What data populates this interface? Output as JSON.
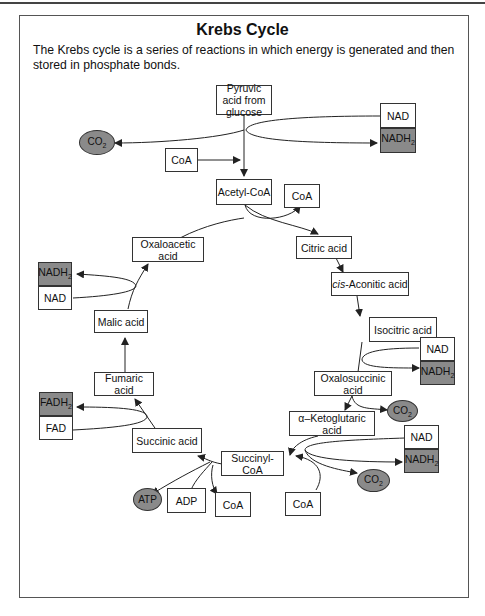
{
  "title": "Krebs Cycle",
  "description": "The Krebs cycle is a series of reactions in which energy is generated and then stored in phosphate bonds.",
  "nodes": {
    "pyruvic": "Pyruvic acid from glucose",
    "acetyl_coa": "Acetyl-CoA",
    "citric": "Citric acid",
    "cis_prefix": "cis",
    "cis_rest": "-Aconitic acid",
    "isocitric": "Isocitric acid",
    "oxalosuccinic": "Oxalosuccinic acid",
    "ketoglutaric": "α–Ketoglutaric acid",
    "succinyl_coa": "Succinyl-CoA",
    "succinic": "Succinic acid",
    "fumaric": "Fumaric acid",
    "malic": "Malic acid",
    "oxaloacetic": "Oxaloacetic acid"
  },
  "cofactors": {
    "nad": "NAD",
    "nadh_base": "NADH",
    "nadh_sub": "2",
    "fad": "FAD",
    "fadh_base": "FADH",
    "fadh_sub": "2",
    "coa": "CoA",
    "co2_base": "CO",
    "co2_sub": "2",
    "atp": "ATP",
    "adp": "ADP"
  },
  "colors": {
    "reduced_fill": "#8a8a8a",
    "line": "#222222"
  }
}
